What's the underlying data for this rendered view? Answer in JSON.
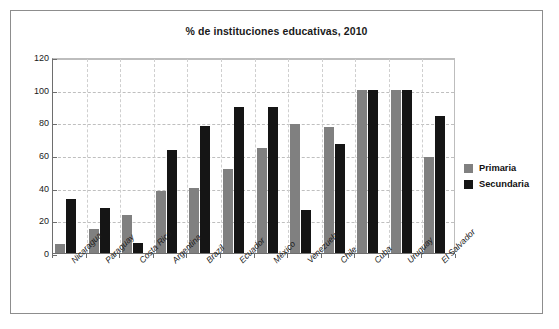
{
  "chart_data": {
    "type": "bar",
    "title": "% de instituciones educativas, 2010",
    "xlabel": "",
    "ylabel": "",
    "ylim": [
      0,
      120
    ],
    "yticks": [
      0,
      20,
      40,
      60,
      80,
      100,
      120
    ],
    "grid": true,
    "legend_position": "right",
    "categories": [
      "Nicaragua",
      "Paraguay",
      "Costa Rica",
      "Argentina",
      "Brazil",
      "Ecuador",
      "México",
      "Venezuela",
      "Chile",
      "Cuba",
      "Uruguay",
      "El Salvador"
    ],
    "series": [
      {
        "name": "Primaria",
        "color": "#808080",
        "values": [
          5.5,
          15,
          23,
          38,
          40,
          51.5,
          64,
          79,
          77,
          100,
          100,
          58.5
        ]
      },
      {
        "name": "Secundaria",
        "color": "#151515",
        "values": [
          33,
          27.5,
          6,
          63,
          78,
          89.5,
          89.5,
          26.5,
          66.5,
          100,
          100,
          84
        ]
      }
    ]
  },
  "legend": {
    "items": [
      {
        "label": "Primaria",
        "color": "#808080"
      },
      {
        "label": "Secundaria",
        "color": "#151515"
      }
    ]
  }
}
